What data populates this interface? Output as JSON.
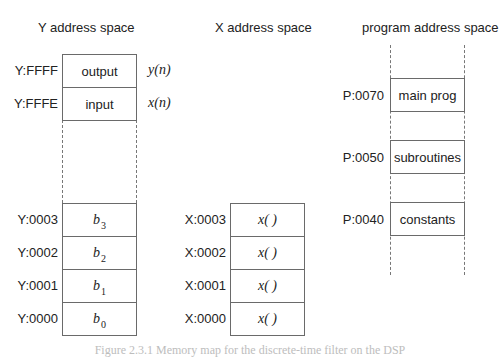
{
  "y_space": {
    "title": "Y address space",
    "rows": [
      {
        "address": "Y:FFFF",
        "content": "output",
        "signal": "y(n)"
      },
      {
        "address": "Y:FFFE",
        "content": "input",
        "signal": "x(n)"
      },
      {
        "address": "Y:0003",
        "content_base": "b",
        "content_sub": "3"
      },
      {
        "address": "Y:0002",
        "content_base": "b",
        "content_sub": "2"
      },
      {
        "address": "Y:0001",
        "content_base": "b",
        "content_sub": "1"
      },
      {
        "address": "Y:0000",
        "content_base": "b",
        "content_sub": "0"
      }
    ]
  },
  "x_space": {
    "title": "X address space",
    "rows": [
      {
        "address": "X:0003",
        "content": "x( )"
      },
      {
        "address": "X:0002",
        "content": "x( )"
      },
      {
        "address": "X:0001",
        "content": "x( )"
      },
      {
        "address": "X:0000",
        "content": "x( )"
      }
    ]
  },
  "program_space": {
    "title": "program address space",
    "rows": [
      {
        "address": "P:0070",
        "content": "main prog"
      },
      {
        "address": "P:0050",
        "content": "subroutines"
      },
      {
        "address": "P:0040",
        "content": "constants"
      }
    ]
  },
  "caption": "Figure 2.3.1  Memory map for the discrete-time filter on the DSP"
}
